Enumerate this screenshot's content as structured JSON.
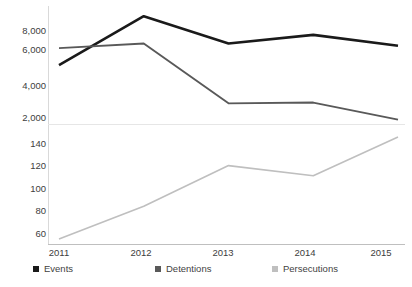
{
  "chart_data": {
    "type": "line",
    "title": "",
    "xlabel": "",
    "ylabel": "",
    "grid": false,
    "legend_position": "bottom",
    "broken_axis": true,
    "categories": [
      "2011",
      "2012",
      "2013",
      "2014",
      "2015"
    ],
    "x": [
      2011,
      2012,
      2013,
      2014,
      2015
    ],
    "series": [
      {
        "name": "Events",
        "color": "#1a1a1a",
        "axis": "top",
        "values": [
          5050,
          8200,
          6450,
          7000,
          6300
        ]
      },
      {
        "name": "Detentions",
        "color": "#595959",
        "axis": "top",
        "values": [
          6150,
          6450,
          2600,
          2650,
          1550
        ]
      },
      {
        "name": "Persecutions",
        "color": "#bfbfbf",
        "axis": "bottom",
        "values": [
          48,
          80,
          120,
          110,
          148
        ]
      }
    ],
    "axes": {
      "top": {
        "ylim": [
          1400,
          8600
        ],
        "ticks": [
          8000,
          6000,
          4000,
          2000
        ],
        "tick_labels": [
          "8,000",
          "6,000",
          "4,000",
          "2,000"
        ]
      },
      "bottom": {
        "ylim": [
          44,
          152
        ],
        "ticks": [
          140,
          120,
          100,
          80,
          60
        ],
        "tick_labels": [
          "140",
          "120",
          "100",
          "80",
          "60"
        ]
      }
    }
  },
  "axis_top": {
    "tick_labels": [
      "8,000",
      "6,000",
      "4,000",
      "2,000"
    ]
  },
  "axis_bottom": {
    "tick_labels": [
      "140",
      "120",
      "100",
      "80",
      "60"
    ]
  },
  "axis_x": {
    "tick_labels": [
      "2011",
      "2012",
      "2013",
      "2014",
      "2015"
    ]
  },
  "legend": {
    "items": [
      {
        "label": "Events",
        "color": "#1a1a1a",
        "marker": "square-marker"
      },
      {
        "label": "Detentions",
        "color": "#595959",
        "marker": "square-marker"
      },
      {
        "label": "Persecutions",
        "color": "#bfbfbf",
        "marker": "square-marker"
      }
    ]
  }
}
